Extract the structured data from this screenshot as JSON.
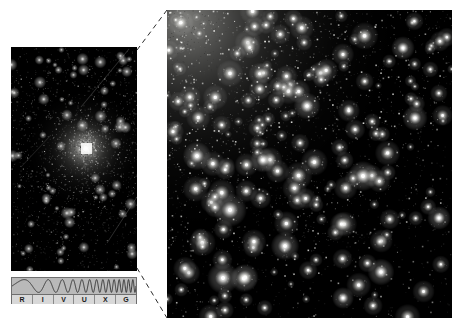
{
  "figure": {
    "background_color": "#ffffff",
    "width": 463,
    "height": 330
  },
  "panels": {
    "wide_field": {
      "name": "globular-cluster-wide-field",
      "description": "Full globular cluster with bright unresolved core",
      "x": 11,
      "y": 47,
      "width": 126,
      "height": 224,
      "background_color": "#000000",
      "core_center_x": 74,
      "core_center_y": 101,
      "core_glow_radius": 62,
      "core_peak_color": "#ffffff",
      "star_count": 2600,
      "saturated_box": {
        "x": 70,
        "y": 96,
        "width": 11,
        "height": 11
      }
    },
    "zoom_field": {
      "name": "globular-cluster-core-zoom",
      "description": "Magnified view resolving individual stars, dense toward upper left",
      "x": 167,
      "y": 10,
      "width": 285,
      "height": 308,
      "background_color": "#000000",
      "density_center_x": 20,
      "density_center_y": 10,
      "star_count": 5200,
      "bright_star_count": 260
    }
  },
  "connectors": {
    "name": "zoom-callout-lines",
    "color": "#2b2b2b",
    "dash": "5,4",
    "width": 1,
    "lines": [
      {
        "x1": 137,
        "y1": 50,
        "x2": 167,
        "y2": 10
      },
      {
        "x1": 137,
        "y1": 268,
        "x2": 167,
        "y2": 318
      }
    ]
  },
  "spectrum": {
    "name": "electromagnetic-spectrum-bar",
    "x": 11,
    "y": 277,
    "width": 126,
    "height": 27,
    "wave_color": "#2a2a2a",
    "band_fill": "#b9b9b9",
    "label_fill": "#d8d8d8",
    "border_color": "#6e6e6e",
    "active_band": "V",
    "bands": [
      {
        "letter": "R",
        "name": "radio"
      },
      {
        "letter": "I",
        "name": "infrared"
      },
      {
        "letter": "V",
        "name": "visible"
      },
      {
        "letter": "U",
        "name": "ultraviolet"
      },
      {
        "letter": "X",
        "name": "x-ray"
      },
      {
        "letter": "G",
        "name": "gamma-ray"
      }
    ]
  }
}
